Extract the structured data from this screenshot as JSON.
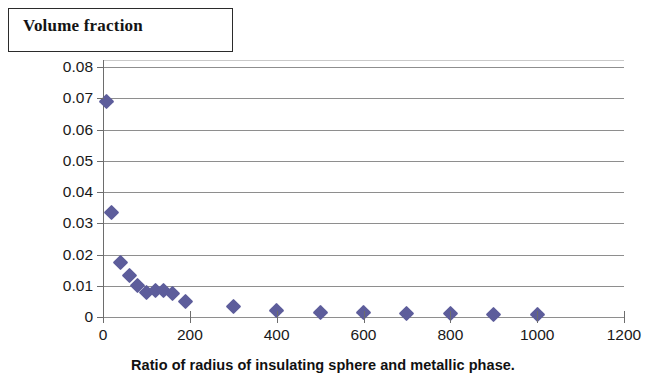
{
  "title": {
    "text": "Volume fraction"
  },
  "axes": {
    "x_title": "Ratio of radius of insulating sphere and metallic phase.",
    "y_title": "",
    "x_ticks": [
      "0",
      "200",
      "400",
      "600",
      "800",
      "1000",
      "1200"
    ],
    "y_ticks": [
      "0.08",
      "0.07",
      "0.06",
      "0.05",
      "0.04",
      "0.03",
      "0.02",
      "0.01",
      "0"
    ]
  },
  "style": {
    "marker_color": "#5d5d9b",
    "gridline_color": "#8e8e8e",
    "axis_color": "#6d6d6d",
    "background": "#ffffff"
  },
  "chart_data": {
    "type": "scatter",
    "title": "Volume fraction",
    "xlabel": "Ratio of radius of insulating sphere and metallic phase.",
    "ylabel": "Volume fraction",
    "xlim": [
      0,
      1200
    ],
    "ylim": [
      0,
      0.08
    ],
    "xticks": [
      0,
      200,
      400,
      600,
      800,
      1000,
      1200
    ],
    "yticks": [
      0,
      0.01,
      0.02,
      0.03,
      0.04,
      0.05,
      0.06,
      0.07,
      0.08
    ],
    "grid": "horizontal",
    "legend": "none",
    "series": [
      {
        "name": "Volume fraction",
        "marker": "diamond",
        "color": "#5d5d9b",
        "points": [
          {
            "x": 8,
            "y": 0.069
          },
          {
            "x": 20,
            "y": 0.0335
          },
          {
            "x": 40,
            "y": 0.0175
          },
          {
            "x": 60,
            "y": 0.0132
          },
          {
            "x": 80,
            "y": 0.01
          },
          {
            "x": 100,
            "y": 0.0078
          },
          {
            "x": 120,
            "y": 0.0085
          },
          {
            "x": 140,
            "y": 0.0085
          },
          {
            "x": 160,
            "y": 0.0075
          },
          {
            "x": 190,
            "y": 0.005
          },
          {
            "x": 300,
            "y": 0.0035
          },
          {
            "x": 400,
            "y": 0.0021
          },
          {
            "x": 500,
            "y": 0.0016
          },
          {
            "x": 600,
            "y": 0.0015
          },
          {
            "x": 700,
            "y": 0.0012
          },
          {
            "x": 800,
            "y": 0.001
          },
          {
            "x": 900,
            "y": 0.0009
          },
          {
            "x": 1000,
            "y": 0.0008
          }
        ]
      }
    ]
  }
}
